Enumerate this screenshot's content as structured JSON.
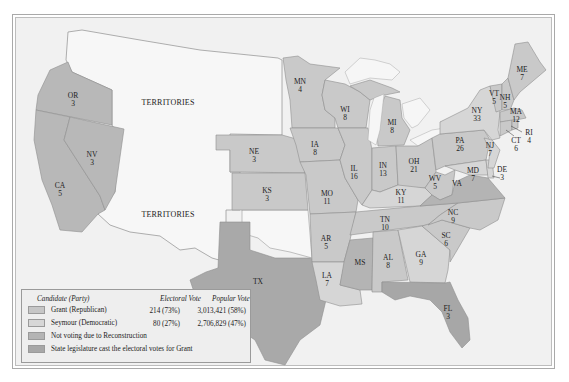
{
  "map": {
    "title": "Election of 1868",
    "colors": {
      "grant": "#c6c6c6",
      "seymour": "#d7d7d7",
      "not_voting": "#b4b4b4",
      "legislature": "#a7a7a7",
      "territory": "#f7f7f7",
      "water": "#efefef",
      "background": "#f1f1f1"
    },
    "territory_labels": [
      "TERRITORIES",
      "TERRITORIES"
    ],
    "states": [
      {
        "abbr": "OR",
        "votes": "3",
        "result": "grant"
      },
      {
        "abbr": "NV",
        "votes": "3",
        "result": "grant"
      },
      {
        "abbr": "CA",
        "votes": "5",
        "result": "grant"
      },
      {
        "abbr": "NE",
        "votes": "3",
        "result": "grant"
      },
      {
        "abbr": "KS",
        "votes": "3",
        "result": "grant"
      },
      {
        "abbr": "TX",
        "votes": "",
        "result": "not_voting"
      },
      {
        "abbr": "MN",
        "votes": "4",
        "result": "grant"
      },
      {
        "abbr": "IA",
        "votes": "8",
        "result": "grant"
      },
      {
        "abbr": "MO",
        "votes": "11",
        "result": "grant"
      },
      {
        "abbr": "AR",
        "votes": "5",
        "result": "grant"
      },
      {
        "abbr": "LA",
        "votes": "7",
        "result": "seymour"
      },
      {
        "abbr": "WI",
        "votes": "8",
        "result": "grant"
      },
      {
        "abbr": "IL",
        "votes": "16",
        "result": "grant"
      },
      {
        "abbr": "MS",
        "votes": "",
        "result": "not_voting"
      },
      {
        "abbr": "MI",
        "votes": "8",
        "result": "grant"
      },
      {
        "abbr": "IN",
        "votes": "13",
        "result": "grant"
      },
      {
        "abbr": "KY",
        "votes": "11",
        "result": "seymour"
      },
      {
        "abbr": "TN",
        "votes": "10",
        "result": "grant"
      },
      {
        "abbr": "AL",
        "votes": "8",
        "result": "grant"
      },
      {
        "abbr": "GA",
        "votes": "9",
        "result": "seymour"
      },
      {
        "abbr": "FL",
        "votes": "3",
        "result": "legislature"
      },
      {
        "abbr": "OH",
        "votes": "21",
        "result": "grant"
      },
      {
        "abbr": "WV",
        "votes": "5",
        "result": "grant"
      },
      {
        "abbr": "VA",
        "votes": "",
        "result": "not_voting"
      },
      {
        "abbr": "NC",
        "votes": "9",
        "result": "grant"
      },
      {
        "abbr": "SC",
        "votes": "6",
        "result": "grant"
      },
      {
        "abbr": "PA",
        "votes": "26",
        "result": "grant"
      },
      {
        "abbr": "NY",
        "votes": "33",
        "result": "seymour"
      },
      {
        "abbr": "VT",
        "votes": "5",
        "result": "grant"
      },
      {
        "abbr": "NH",
        "votes": "5",
        "result": "grant"
      },
      {
        "abbr": "ME",
        "votes": "7",
        "result": "grant"
      },
      {
        "abbr": "MA",
        "votes": "12",
        "result": "grant"
      },
      {
        "abbr": "RI",
        "votes": "4",
        "result": "grant"
      },
      {
        "abbr": "CT",
        "votes": "6",
        "result": "grant"
      },
      {
        "abbr": "NJ",
        "votes": "7",
        "result": "seymour"
      },
      {
        "abbr": "MD",
        "votes": "7",
        "result": "seymour"
      },
      {
        "abbr": "DE",
        "votes": "3",
        "result": "seymour"
      }
    ]
  },
  "legend": {
    "headers": {
      "candidate": "Candidate (Party)",
      "electoral": "Electoral Vote",
      "popular": "Popular Vote"
    },
    "rows": [
      {
        "label": "Grant (Republican)",
        "electoral": "214 (73%)",
        "popular": "3,013,421 (58%)"
      },
      {
        "label": "Seymour (Democratic)",
        "electoral": "80 (27%)",
        "popular": "2,706,829 (47%)"
      },
      {
        "label": "Not voting due to Reconstruction",
        "electoral": "",
        "popular": ""
      },
      {
        "label": "State legislature cast the electoral votes for Grant",
        "electoral": "",
        "popular": ""
      }
    ]
  }
}
